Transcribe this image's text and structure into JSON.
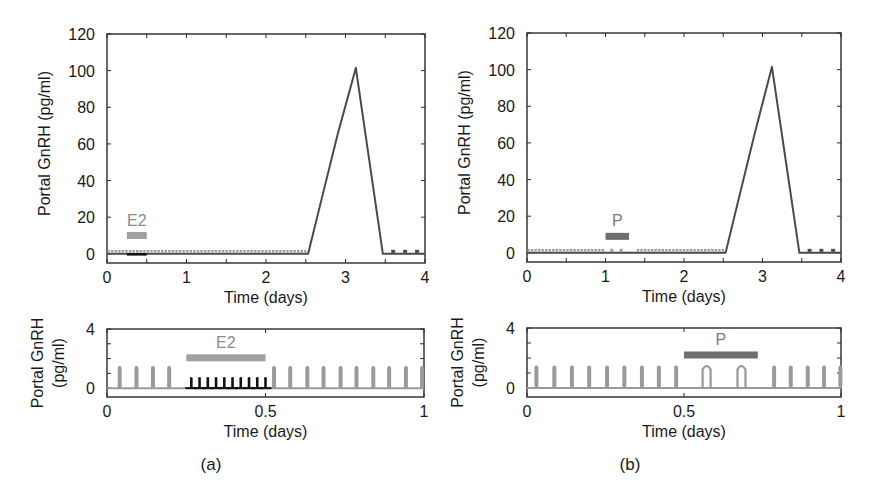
{
  "figure": {
    "panel_labels": [
      "(a)",
      "(b)"
    ]
  },
  "colors": {
    "axis": "#2a2a2a",
    "surge_line": "#4a4a4a",
    "basal_grey": "#9a9a9a",
    "e2_bar": "#a0a0a0",
    "e2_label": "#8c8c8c",
    "p_bar": "#6e6e6e",
    "p_label": "#7a7a7a",
    "e2_pulses": "#111111"
  },
  "chart_data": [
    {
      "id": "a-top",
      "type": "line",
      "title": "",
      "xlabel": "Time (days)",
      "ylabel": "Portal GnRH (pg/ml)",
      "xlim": [
        0,
        4
      ],
      "ylim": [
        -5,
        120
      ],
      "xticks": [
        0,
        1,
        2,
        3,
        4
      ],
      "xticks_minor": [
        0.5,
        1.5,
        2.5,
        3.5
      ],
      "yticks": [
        0,
        20,
        40,
        60,
        80,
        100,
        120
      ],
      "grid": false,
      "legend": null,
      "annotation": {
        "label": "E2",
        "bar_x": [
          0.25,
          0.5
        ],
        "bar_y": 10
      },
      "series": [
        {
          "name": "surge",
          "style": "solid",
          "x": [
            0,
            2.53,
            2.7,
            2.9,
            3.13,
            3.47,
            4.0
          ],
          "y": [
            0,
            0,
            30,
            65,
            101.5,
            0,
            0
          ]
        },
        {
          "name": "basal pulses (dotted, grey)",
          "style": "dotted",
          "x_range": [
            0,
            2.53
          ],
          "y": 1
        },
        {
          "name": "suppressed during E2 (black)",
          "style": "solid",
          "x_range": [
            0.25,
            0.5
          ],
          "y": 0
        },
        {
          "name": "post-surge pulses",
          "style": "dots",
          "x": [
            3.6,
            3.75,
            3.9
          ],
          "y": 1
        }
      ]
    },
    {
      "id": "a-bottom",
      "type": "line",
      "title": "",
      "xlabel": "Time (days)",
      "ylabel": "Portal GnRH (pg/ml)",
      "xlim": [
        0,
        1
      ],
      "ylim": [
        -0.6,
        4
      ],
      "xticks": [
        0,
        0.5,
        1
      ],
      "xtick_labels": [
        "0",
        "0.5",
        "1"
      ],
      "yticks": [
        0,
        4
      ],
      "yticks_minor": [
        1,
        2,
        3
      ],
      "grid": false,
      "annotation": {
        "label": "E2",
        "bar_x": [
          0.25,
          0.5
        ],
        "bar_y": 2.05
      },
      "series": [
        {
          "name": "grey pulses",
          "pulse_height": 1.5,
          "x": [
            0.04,
            0.093,
            0.145,
            0.196,
            0.527,
            0.578,
            0.632,
            0.683,
            0.737,
            0.787,
            0.84,
            0.89,
            0.943,
            0.994
          ]
        },
        {
          "name": "black pulses (E2)",
          "pulse_height": 0.75,
          "x": [
            0.266,
            0.292,
            0.318,
            0.344,
            0.37,
            0.396,
            0.422,
            0.448,
            0.474,
            0.5
          ]
        }
      ]
    },
    {
      "id": "b-top",
      "type": "line",
      "title": "",
      "xlabel": "Time (days)",
      "ylabel": "Portal GnRH (pg/ml)",
      "xlim": [
        0,
        4
      ],
      "ylim": [
        -5,
        120
      ],
      "xticks": [
        0,
        1,
        2,
        3,
        4
      ],
      "xticks_minor": [
        0.5,
        1.5,
        2.5,
        3.5
      ],
      "yticks": [
        0,
        20,
        40,
        60,
        80,
        100,
        120
      ],
      "grid": false,
      "annotation": {
        "label": "P",
        "bar_x": [
          1.0,
          1.3
        ],
        "bar_y": 9
      },
      "series": [
        {
          "name": "surge",
          "style": "solid",
          "x": [
            0,
            2.53,
            2.7,
            2.9,
            3.12,
            3.47,
            4.0
          ],
          "y": [
            0,
            0,
            30,
            65,
            101.5,
            0,
            0
          ]
        },
        {
          "name": "basal pulses (dotted, grey)",
          "style": "dotted",
          "x_range": [
            0,
            2.53
          ],
          "y": 1,
          "sparse_range": [
            1.0,
            1.4
          ]
        },
        {
          "name": "post-surge pulses",
          "style": "dots",
          "x": [
            3.6,
            3.75,
            3.9
          ],
          "y": 1
        }
      ]
    },
    {
      "id": "b-bottom",
      "type": "line",
      "title": "",
      "xlabel": "Time (days)",
      "ylabel": "Portal GnRH (pg/ml)",
      "xlim": [
        0,
        1
      ],
      "ylim": [
        -0.6,
        4
      ],
      "xticks": [
        0,
        0.5,
        1
      ],
      "xtick_labels": [
        "0",
        "0.5",
        "1"
      ],
      "yticks": [
        0,
        4
      ],
      "yticks_minor": [
        1,
        2,
        3
      ],
      "grid": false,
      "annotation": {
        "label": "P",
        "bar_x": [
          0.5,
          0.735
        ],
        "bar_y": 2.2
      },
      "series": [
        {
          "name": "grey pulses",
          "pulse_height": 1.5,
          "x": [
            0.03,
            0.087,
            0.143,
            0.198,
            0.255,
            0.31,
            0.366,
            0.42,
            0.475,
            0.787,
            0.84,
            0.894,
            0.946,
            0.998
          ]
        },
        {
          "name": "wide pulses (P)",
          "pulse_height": 1.5,
          "wide": true,
          "x": [
            0.572,
            0.683
          ]
        }
      ]
    }
  ],
  "panels": [
    {
      "box": {
        "left": 107,
        "top": 34,
        "right": 425,
        "bottom": 263
      },
      "chart": 0
    },
    {
      "box": {
        "left": 107,
        "top": 329,
        "right": 424,
        "bottom": 397
      },
      "chart": 1
    },
    {
      "box": {
        "left": 527,
        "top": 33,
        "right": 841,
        "bottom": 262
      },
      "chart": 2
    },
    {
      "box": {
        "left": 527,
        "top": 328,
        "right": 841,
        "bottom": 397
      },
      "chart": 3
    }
  ]
}
